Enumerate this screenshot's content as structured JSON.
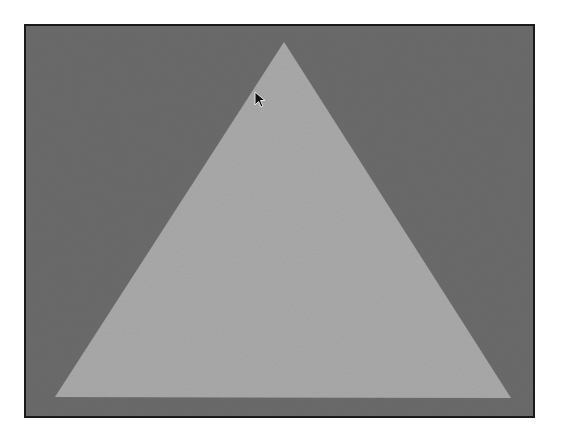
{
  "canvas": {
    "background_color": "#6b6b6b",
    "frame_border_color": "#1a1a1a"
  },
  "shape": {
    "type": "triangle",
    "fill_color": "#a9a9a9",
    "points": "284,42 55,397 511,398"
  },
  "cursor": {
    "icon": "arrow-pointer-icon",
    "x": 254,
    "y": 91
  }
}
